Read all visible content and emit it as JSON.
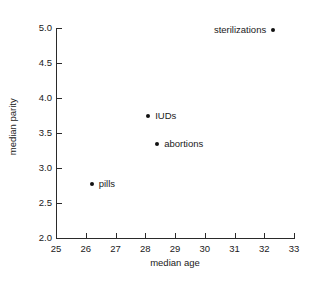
{
  "chart_data": {
    "type": "scatter",
    "title": "",
    "xlabel": "median age",
    "ylabel": "median parity",
    "xlim": [
      25,
      33
    ],
    "ylim": [
      2.0,
      5.0
    ],
    "xticks": [
      "25",
      "26",
      "27",
      "28",
      "29",
      "30",
      "31",
      "32",
      "33"
    ],
    "yticks": [
      "2.0",
      "2.5",
      "3.0",
      "3.5",
      "4.0",
      "4.5",
      "5.0"
    ],
    "grid": false,
    "legend": "none",
    "point_color": "#111111",
    "axis_color": "#2a2a2a",
    "points": [
      {
        "label": "pills",
        "x": 26.2,
        "y": 2.77,
        "label_side": "right"
      },
      {
        "label": "IUDs",
        "x": 28.1,
        "y": 3.74,
        "label_side": "right"
      },
      {
        "label": "abortions",
        "x": 28.4,
        "y": 3.34,
        "label_side": "right"
      },
      {
        "label": "sterilizations",
        "x": 32.3,
        "y": 4.97,
        "label_side": "left"
      }
    ]
  }
}
